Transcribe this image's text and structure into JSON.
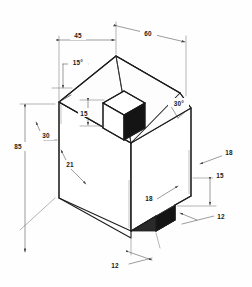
{
  "drawing": {
    "type": "isometric-technical-drawing",
    "title": "Isometric house-shaped block with roof boss and base notch",
    "background_color": "#fefefe",
    "line_color": "#1c1c1c",
    "dimension_color": "#4a4a4a",
    "shade_color": "#141414",
    "units_note": "",
    "dimensions": [
      {
        "id": "top-left-width",
        "label": "45",
        "kind": "linear",
        "position": "top-left"
      },
      {
        "id": "top-right-width",
        "label": "60",
        "kind": "linear",
        "position": "top-right"
      },
      {
        "id": "left-height",
        "label": "85",
        "kind": "linear",
        "position": "left"
      },
      {
        "id": "left-roof-angle",
        "label": "15°",
        "kind": "angular",
        "position": "upper-left"
      },
      {
        "id": "right-roof-angle",
        "label": "30°",
        "kind": "angular",
        "position": "upper-right"
      },
      {
        "id": "left-offset",
        "label": "30",
        "kind": "linear",
        "position": "left-middle"
      },
      {
        "id": "roof-eave",
        "label": "21",
        "kind": "linear",
        "position": "center-left"
      },
      {
        "id": "boss-height",
        "label": "15",
        "kind": "linear",
        "position": "center"
      },
      {
        "id": "right-upper-depth",
        "label": "18",
        "kind": "linear",
        "position": "right-upper"
      },
      {
        "id": "notch-inner-depth",
        "label": "18",
        "kind": "linear",
        "position": "center-lower"
      },
      {
        "id": "notch-height",
        "label": "15",
        "kind": "linear",
        "position": "right-lower"
      },
      {
        "id": "notch-width-right",
        "label": "12",
        "kind": "linear",
        "position": "right-bottom"
      },
      {
        "id": "notch-width-front",
        "label": "12",
        "kind": "linear",
        "position": "bottom"
      }
    ]
  }
}
